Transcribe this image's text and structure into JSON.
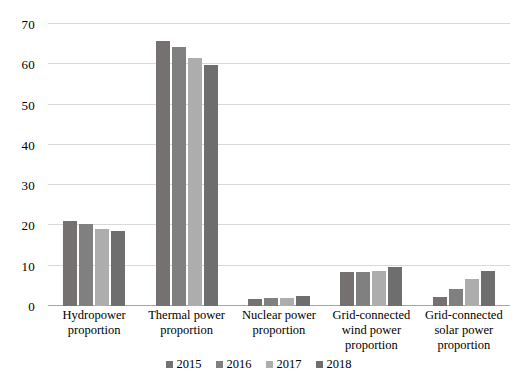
{
  "chart_data": {
    "type": "bar",
    "title": "",
    "subtitle": "",
    "xlabel": "",
    "ylabel": "",
    "ylim": [
      0,
      70
    ],
    "yticks": [
      0,
      10,
      20,
      30,
      40,
      50,
      60,
      70
    ],
    "grid": true,
    "legend_position": "bottom",
    "categories": [
      "Hydropower proportion",
      "Thermal power proportion",
      "Nuclear power proportion",
      "Grid-connected wind power proportion",
      "Grid-connected solar power proportion"
    ],
    "category_lines": [
      [
        "Hydropower",
        "proportion"
      ],
      [
        "Thermal power",
        "proportion"
      ],
      [
        "Nuclear power",
        "proportion"
      ],
      [
        "Grid-connected",
        "wind power",
        "proportion"
      ],
      [
        "Grid-connected",
        "solar power",
        "proportion"
      ]
    ],
    "series": [
      {
        "name": "2015",
        "color": "#767171",
        "values": [
          21.2,
          65.8,
          1.8,
          8.4,
          2.2
        ]
      },
      {
        "name": "2016",
        "color": "#808080",
        "values": [
          20.4,
          64.2,
          2.0,
          8.5,
          4.2
        ]
      },
      {
        "name": "2017",
        "color": "#ADADAD",
        "values": [
          19.2,
          61.5,
          2.0,
          8.6,
          6.8
        ]
      },
      {
        "name": "2018",
        "color": "#6E6E6E",
        "values": [
          18.5,
          59.8,
          2.4,
          9.7,
          8.8
        ]
      }
    ]
  },
  "style": {
    "background": "#ffffff",
    "gridline_color": "#d9d9d9",
    "axis_color": "#a6a6a6",
    "text_color": "#000000"
  }
}
